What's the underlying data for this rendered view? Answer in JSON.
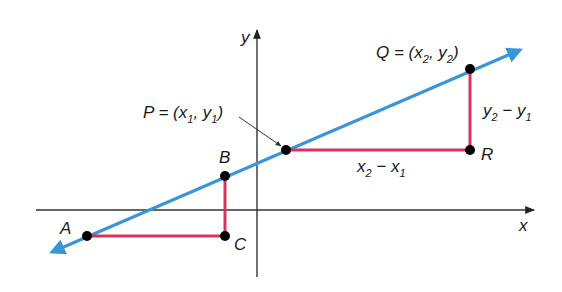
{
  "diagram": {
    "colors": {
      "axis": "#333333",
      "line": "#3a95d8",
      "segment": "#d6335e",
      "point": "#000000",
      "text": "#1a1a1a",
      "background": "#ffffff"
    },
    "axes": {
      "x_label": "x",
      "y_label": "y",
      "origin_px": [
        257,
        210
      ]
    },
    "line": {
      "start_px": [
        50,
        253
      ],
      "end_px": [
        522,
        49
      ]
    },
    "points": {
      "A": {
        "label": "A",
        "px": [
          87,
          236
        ]
      },
      "B": {
        "label": "B",
        "px": [
          225,
          176
        ]
      },
      "C": {
        "label": "C",
        "px": [
          225,
          236
        ]
      },
      "P": {
        "label": "P",
        "px": [
          286,
          150
        ]
      },
      "Q": {
        "label": "Q",
        "px": [
          470,
          69
        ]
      },
      "R": {
        "label": "R",
        "px": [
          470,
          150
        ]
      }
    },
    "labels": {
      "P_prefix": "P = (x",
      "P_sub1": "1",
      "P_mid": ", y",
      "P_sub2": "1",
      "P_suffix": ")",
      "Q_prefix": "Q = (x",
      "Q_sub1": "2",
      "Q_mid": ", y",
      "Q_sub2": "2",
      "Q_suffix": ")",
      "rise_a": "y",
      "rise_sub_a": "2",
      "rise_op": " − y",
      "rise_sub_b": "1",
      "run_a": "x",
      "run_sub_a": "2",
      "run_op": " − x",
      "run_sub_b": "1"
    }
  }
}
